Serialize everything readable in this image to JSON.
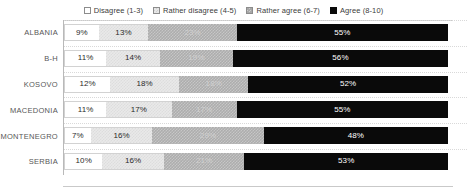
{
  "legend": {
    "position": "top-center",
    "items": [
      {
        "label": "Disagree (1-3)",
        "swatch": "legend-swatch-disagree",
        "color": "#ffffff"
      },
      {
        "label": "Rather disagree (4-5)",
        "swatch": "legend-swatch-rather-disagree",
        "color": "#e9e9e9"
      },
      {
        "label": "Rather agree (6-7)",
        "swatch": "legend-swatch-rather-agree",
        "color": "#adadad"
      },
      {
        "label": "Agree (8-10)",
        "swatch": "legend-swatch-agree",
        "color": "#0a0a0a"
      }
    ]
  },
  "chart_data": {
    "type": "bar",
    "orientation": "horizontal",
    "stacked": true,
    "normalized": true,
    "title": "",
    "subtitle": "",
    "xlabel": "",
    "ylabel": "",
    "xlim": [
      0,
      100
    ],
    "grid": true,
    "legend_position": "top-center",
    "categories": [
      "ALBANIA",
      "B-H",
      "KOSOVO",
      "MACEDONIA",
      "MONTENEGRO",
      "SERBIA"
    ],
    "series": [
      {
        "name": "Disagree (1-3)",
        "color": "#ffffff",
        "values": [
          9,
          11,
          12,
          11,
          7,
          10
        ]
      },
      {
        "name": "Rather disagree (4-5)",
        "color": "#e9e9e9",
        "values": [
          13,
          14,
          18,
          17,
          16,
          16
        ]
      },
      {
        "name": "Rather agree (6-7)",
        "color": "#adadad",
        "values": [
          23,
          19,
          18,
          17,
          29,
          21
        ]
      },
      {
        "name": "Agree (8-10)",
        "color": "#0a0a0a",
        "values": [
          55,
          56,
          52,
          55,
          48,
          53
        ]
      }
    ],
    "data_labels": [
      {
        "category": "ALBANIA",
        "labels": [
          "9%",
          "13%",
          "23%",
          "55%"
        ]
      },
      {
        "category": "B-H",
        "labels": [
          "11%",
          "14%",
          "19%",
          "56%"
        ]
      },
      {
        "category": "KOSOVO",
        "labels": [
          "12%",
          "18%",
          "18%",
          "52%"
        ]
      },
      {
        "category": "MACEDONIA",
        "labels": [
          "11%",
          "17%",
          "17%",
          "55%"
        ]
      },
      {
        "category": "MONTENEGRO",
        "labels": [
          "7%",
          "16%",
          "29%",
          "48%"
        ]
      },
      {
        "category": "SERBIA",
        "labels": [
          "10%",
          "16%",
          "21%",
          "53%"
        ]
      }
    ]
  }
}
